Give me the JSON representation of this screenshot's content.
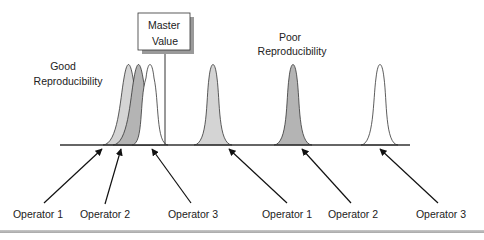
{
  "diagram": {
    "title": "Reproducibility",
    "master_value_box": {
      "line1": "Master",
      "line2": "Value"
    },
    "groups": [
      {
        "label_line1": "Good",
        "label_line2": "Reproducibility",
        "operators": [
          {
            "label": "Operator 1",
            "fill": "#d4d4d4"
          },
          {
            "label": "Operator 2",
            "fill": "#b4b4b4"
          },
          {
            "label": "Operator 3",
            "fill": "#ffffff"
          }
        ]
      },
      {
        "label_line1": "Poor",
        "label_line2": "Reproducibility",
        "operators": [
          {
            "label": "Operator 1",
            "fill": "#d4d4d4"
          },
          {
            "label": "Operator 2",
            "fill": "#b4b4b4"
          },
          {
            "label": "Operator 3",
            "fill": "#ffffff"
          }
        ]
      }
    ],
    "colors": {
      "line": "#333333",
      "shadow": "#9a9a9a",
      "light_fill": "#d4d4d4",
      "dark_fill": "#b4b4b4"
    }
  }
}
